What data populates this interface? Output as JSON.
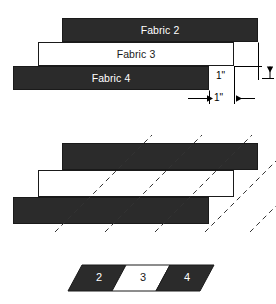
{
  "figure": {
    "colors": {
      "dark_fabric": "#2b2b2b",
      "light_fabric": "#ffffff",
      "outline": "#1a1a1a",
      "background": "#ffffff",
      "dim_line": "#000000",
      "cut_line": "#333333"
    }
  },
  "top_diagram": {
    "strips": [
      {
        "name": "fabric-2",
        "label": "Fabric 2",
        "tone": "dark",
        "x": 62,
        "y": 18,
        "w": 196,
        "h": 24
      },
      {
        "name": "fabric-3",
        "label": "Fabric 3",
        "tone": "light",
        "x": 38,
        "y": 42,
        "w": 196,
        "h": 24
      },
      {
        "name": "fabric-4",
        "label": "Fabric 4",
        "tone": "dark",
        "x": 13,
        "y": 66,
        "w": 196,
        "h": 24
      }
    ],
    "dimensions": [
      {
        "name": "vertical-offset",
        "label": "1\"",
        "value": "1",
        "unit": "inch",
        "orientation": "vertical",
        "label_x": 233,
        "label_y": 72
      },
      {
        "name": "horizontal-offset",
        "label": "1\"",
        "value": "1",
        "unit": "inch",
        "orientation": "horizontal",
        "label_x": 215,
        "label_y": 98
      }
    ]
  },
  "bottom_diagram": {
    "strips": [
      {
        "name": "fabric-2-sewn",
        "tone": "dark",
        "x": 62,
        "y": 143,
        "w": 196,
        "h": 27
      },
      {
        "name": "fabric-3-sewn",
        "tone": "light",
        "x": 38,
        "y": 170,
        "w": 196,
        "h": 27
      },
      {
        "name": "fabric-4-sewn",
        "tone": "dark",
        "x": 13,
        "y": 197,
        "w": 196,
        "h": 27
      }
    ],
    "cut_lines": {
      "name": "bias-cut-lines",
      "style": "dashed",
      "angle_degrees": 45,
      "count": 6,
      "description": "dashed 45-degree bias cutting lines across the sewn strip set"
    }
  },
  "result_strip": {
    "name": "bias-cut-unit",
    "shape": "parallelogram",
    "segments": [
      {
        "name": "segment-2",
        "label": "2",
        "tone": "dark"
      },
      {
        "name": "segment-3",
        "label": "3",
        "tone": "light"
      },
      {
        "name": "segment-4",
        "label": "4",
        "tone": "dark"
      }
    ],
    "x": 68,
    "y": 265,
    "w": 132,
    "h": 26,
    "skew": 14
  }
}
